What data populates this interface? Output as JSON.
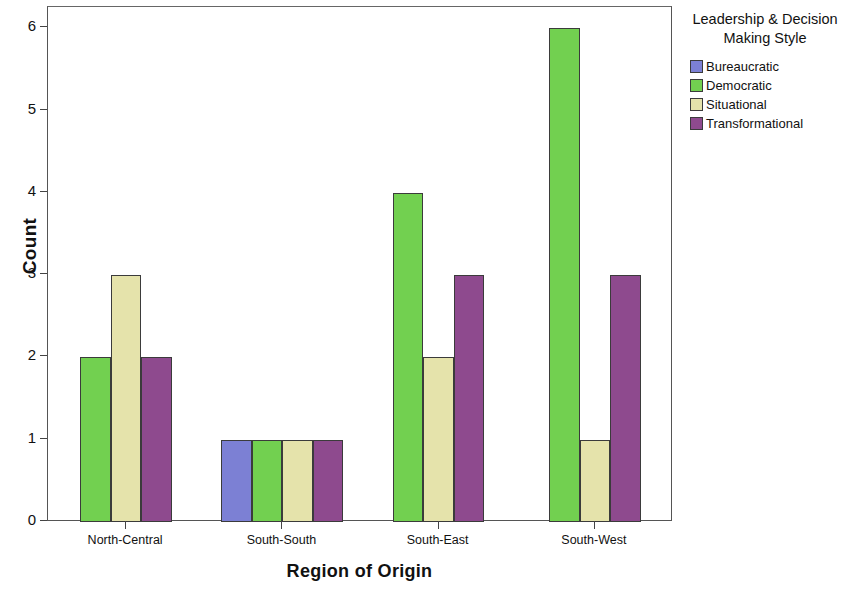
{
  "chart_data": {
    "type": "bar",
    "title": "",
    "xlabel": "Region of Origin",
    "ylabel": "Count",
    "categories": [
      "North-Central",
      "South-South",
      "South-East",
      "South-West"
    ],
    "series": [
      {
        "name": "Bureaucratic",
        "color": "#7c80d4",
        "values": [
          0,
          1,
          0,
          0
        ]
      },
      {
        "name": "Democratic",
        "color": "#72d050",
        "values": [
          2,
          1,
          4,
          6
        ]
      },
      {
        "name": "Situational",
        "color": "#e5e3ab",
        "values": [
          3,
          1,
          2,
          1
        ]
      },
      {
        "name": "Transformational",
        "color": "#8e4a8e",
        "values": [
          2,
          1,
          3,
          3
        ]
      }
    ],
    "ylim": [
      0,
      6
    ],
    "yticks": [
      "0",
      "1",
      "2",
      "3",
      "4",
      "5",
      "6"
    ],
    "grid": false,
    "legend_position": "right",
    "legend_title": "Leadership & Decision Making Style"
  },
  "legend": {
    "title_line1": "Leadership & Decision",
    "title_line2": "Making Style",
    "items": [
      {
        "label": "Bureaucratic",
        "color": "#7c80d4"
      },
      {
        "label": "Democratic",
        "color": "#72d050"
      },
      {
        "label": "Situational",
        "color": "#e5e3ab"
      },
      {
        "label": "Transformational",
        "color": "#8e4a8e"
      }
    ]
  },
  "axes": {
    "y_title": "Count",
    "x_title": "Region of Origin",
    "y_tick_labels": [
      "0",
      "1",
      "2",
      "3",
      "4",
      "5",
      "6"
    ],
    "x_tick_labels": [
      "North-Central",
      "South-South",
      "South-East",
      "South-West"
    ]
  }
}
